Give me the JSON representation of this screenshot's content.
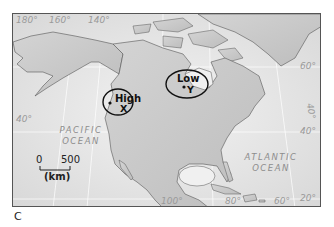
{
  "panel_label": "C",
  "longitude_labels_top": [
    "180°",
    "160°",
    "140°"
  ],
  "longitude_labels_bottom": [
    "100°",
    "80°",
    "60°"
  ],
  "latitude_labels_right": [
    "60°",
    "40°",
    "20°"
  ],
  "latitude_labels_left": [
    "40°"
  ],
  "oblique_label": "40°",
  "oceans": {
    "pacific": {
      "line1": "PACIFIC",
      "line2": "OCEAN"
    },
    "atlantic": {
      "line1": "ATLANTIC",
      "line2": "OCEAN"
    }
  },
  "pressure_systems": [
    {
      "label": "High",
      "point": "X"
    },
    {
      "label": "Low",
      "point": "Y"
    }
  ],
  "scale_bar": {
    "start": "0",
    "end": "500",
    "unit": "(km)"
  },
  "colors": {
    "land": "#c9c9c9",
    "ocean": "#e4e4e4",
    "outline": "#222222"
  }
}
